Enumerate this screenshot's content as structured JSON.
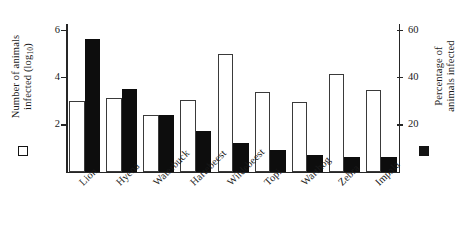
{
  "chart_data": {
    "type": "bar",
    "title": "",
    "categories": [
      "Lion",
      "Hyena",
      "Waterbuck",
      "Hartebeest",
      "Wildebeest",
      "Topi",
      "Warthog",
      "Zebra",
      "Impala"
    ],
    "series": [
      {
        "name": "Number of animals infected (log10)",
        "marker": "open-square",
        "axis": "left",
        "values": [
          3.0,
          3.1,
          2.4,
          3.05,
          5.0,
          3.35,
          2.95,
          4.15,
          3.45
        ]
      },
      {
        "name": "Percentage of animals infected",
        "marker": "filled-square",
        "axis": "right",
        "values": [
          56,
          35,
          24,
          17,
          12,
          9,
          7,
          6,
          6
        ]
      }
    ],
    "left_axis": {
      "label_lines": [
        "Number of animals",
        "infected (log",
        "10",
        ")"
      ],
      "ticks": [
        2,
        4,
        6
      ],
      "tick_labels": [
        "2",
        "4",
        "6"
      ],
      "ylim": [
        0,
        6.25
      ]
    },
    "right_axis": {
      "label_lines": [
        "Percentage of",
        "animals infected"
      ],
      "ticks": [
        20,
        40,
        60
      ],
      "tick_labels": [
        "20",
        "40",
        "60"
      ],
      "ylim": [
        0,
        62.5
      ]
    },
    "grid": false,
    "legend_position": "axis-labels",
    "colors": {
      "open_bar_fill": "#ffffff",
      "open_bar_edge": "#3a3a3a",
      "filled_bar": "#0d0d0d",
      "axis": "#262626",
      "text": "#1a1a1a",
      "background": "#ffffff"
    }
  },
  "axis_titles": {
    "left_part1": "Number of animals",
    "left_part2": "infected (log",
    "left_sub": "10",
    "left_part3": ")",
    "right_part1": "Percentage of",
    "right_part2": "animals infected"
  }
}
